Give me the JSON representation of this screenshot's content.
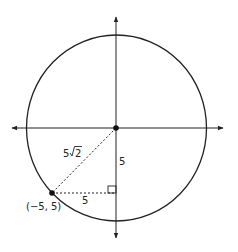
{
  "diagram": {
    "type": "coordinate-circle",
    "colors": {
      "stroke": "#222222",
      "background": "#ffffff"
    },
    "labels": {
      "point": "(−5, 5)",
      "hypotenuse_coefficient": "5",
      "hypotenuse_radicand": "2",
      "vertical_leg": "5",
      "horizontal_leg": "5"
    },
    "elements": {
      "origin": {
        "x": 116,
        "y": 128
      },
      "point": {
        "x": 52,
        "y": 193
      },
      "circle_radius_px": 92
    }
  }
}
